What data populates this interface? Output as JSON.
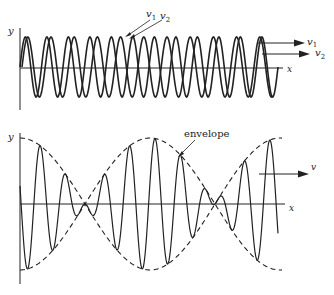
{
  "top_panel": {
    "y_label": "y",
    "x_label": "x",
    "wave1_label": "v",
    "wave1_sub": "1",
    "wave2_label": "v",
    "wave2_sub": "2",
    "arrow1_label": "v",
    "arrow1_sub": "1",
    "arrow2_label": "v",
    "arrow2_sub": "2"
  },
  "bottom_panel": {
    "y_label": "y",
    "x_label": "x",
    "envelope_label": "envelope",
    "arrow_label": "v"
  },
  "colors": {
    "ink": "#222222",
    "background": "#ffffff"
  }
}
